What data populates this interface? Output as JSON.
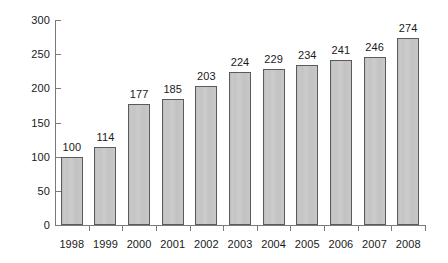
{
  "chart_data": {
    "type": "bar",
    "title": "",
    "subtitle": "",
    "xlabel": "",
    "ylabel": "",
    "categories": [
      "1998",
      "1999",
      "2000",
      "2001",
      "2002",
      "2003",
      "2004",
      "2005",
      "2006",
      "2007",
      "2008"
    ],
    "values": [
      100,
      114,
      177,
      185,
      203,
      224,
      229,
      234,
      241,
      246,
      274
    ],
    "value_labels": [
      "100",
      "114",
      "177",
      "185",
      "203",
      "224",
      "229",
      "234",
      "241",
      "246",
      "274"
    ],
    "ylim": [
      0,
      300
    ],
    "ytick_values": [
      0,
      50,
      100,
      150,
      200,
      250,
      300
    ],
    "ytick_labels": [
      "0",
      "50",
      "100",
      "150",
      "200",
      "250",
      "300"
    ],
    "grid": false,
    "legend": null,
    "legend_position": "none",
    "annotations": [],
    "colors": {
      "bar_fill": "#c6c6c6",
      "bar_border": "#5a5a5a",
      "axis": "#7a7a7a",
      "text": "#1a1a1a",
      "background": "#ffffff"
    }
  }
}
